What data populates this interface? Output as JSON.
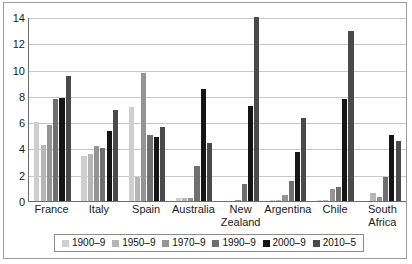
{
  "chart_data": {
    "type": "bar",
    "title": "",
    "subtitle": "",
    "xlabel": "",
    "ylabel": "",
    "ylim": [
      0,
      14
    ],
    "ytick_step": 2,
    "yticks": [
      "0",
      "2",
      "4",
      "6",
      "8",
      "10",
      "12",
      "14"
    ],
    "grid": true,
    "grid_axis": "y",
    "legend_position": "bottom",
    "categories": [
      "France",
      "Italy",
      "Spain",
      "Australia",
      "New\nZealand",
      "Argentina",
      "Chile",
      "South\nAfrica"
    ],
    "series": [
      {
        "name": "1900–9",
        "color": "#cfcfcf",
        "values": [
          6.0,
          3.4,
          7.15,
          0.25,
          0.0,
          0.05,
          0.05,
          0.0
        ]
      },
      {
        "name": "1950–9",
        "color": "#b6b6b6",
        "values": [
          4.25,
          3.6,
          1.8,
          0.2,
          0.0,
          0.05,
          0.05,
          0.6
        ]
      },
      {
        "name": "1970–9",
        "color": "#949494",
        "values": [
          5.8,
          4.2,
          9.75,
          0.25,
          0.05,
          0.45,
          0.9,
          0.3
        ]
      },
      {
        "name": "1990–9",
        "color": "#6f6f6f",
        "values": [
          7.75,
          4.0,
          5.05,
          2.7,
          1.3,
          1.55,
          1.1,
          1.85
        ]
      },
      {
        "name": "2000–9",
        "color": "#151515",
        "values": [
          7.85,
          5.3,
          4.85,
          8.5,
          7.2,
          3.7,
          7.8,
          5.0
        ]
      },
      {
        "name": "2010–5",
        "color": "#4a4a4a",
        "values": [
          9.5,
          6.9,
          5.6,
          4.45,
          14.0,
          6.3,
          12.95,
          4.55
        ]
      }
    ]
  }
}
